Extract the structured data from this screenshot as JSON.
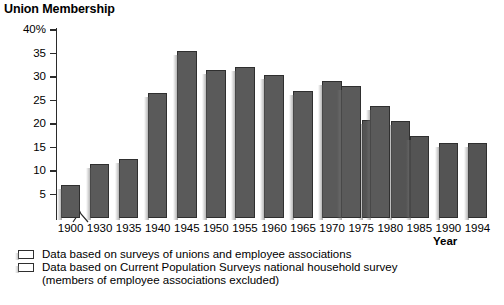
{
  "chart_data": {
    "type": "bar",
    "title": "Union Membership",
    "xlabel": "Year",
    "ylabel": "",
    "ylim": [
      0,
      40
    ],
    "ytick_labels": [
      "40%",
      "35",
      "30",
      "25",
      "20",
      "15",
      "10",
      "5"
    ],
    "ytick_values": [
      40,
      35,
      30,
      25,
      20,
      15,
      10,
      5
    ],
    "grid": false,
    "legend_position": "below-axis-left",
    "axis_break": true,
    "axis_break_note": "x-axis break between 1900 and 1930",
    "categories": [
      "1900",
      "1930",
      "1935",
      "1940",
      "1945",
      "1950",
      "1955",
      "1960",
      "1965",
      "1970",
      "1975",
      "1980",
      "1985",
      "1990",
      "1994"
    ],
    "series": [
      {
        "name": "Data based on surveys of unions and employee associations",
        "color": "#5a5a5a",
        "values": [
          7.0,
          11.5,
          12.6,
          26.5,
          35.5,
          31.5,
          32.2,
          30.4,
          27.1,
          29.1,
          28.1,
          23.8,
          null,
          null,
          null
        ]
      },
      {
        "name": "Data based on Current Population Surveys national household survey (members of employee associations excluded)",
        "color": "#545454",
        "values": [
          null,
          null,
          null,
          null,
          null,
          null,
          null,
          null,
          null,
          null,
          20.9,
          20.7,
          17.4,
          15.9,
          15.9
        ]
      }
    ]
  },
  "legend": {
    "entries": [
      {
        "label": "Data based on surveys of unions and employee associations",
        "swatch_color": "#5a5a5a"
      },
      {
        "label": "Data based on Current Population Surveys national household survey",
        "swatch_color": "#545454"
      }
    ],
    "note": "(members of employee associations excluded)"
  },
  "axis": {
    "title": "Union Membership",
    "x_title": "Year",
    "y_labels": [
      "40%",
      "35",
      "30",
      "25",
      "20",
      "15",
      "10",
      "5"
    ],
    "x_labels": [
      "1900",
      "1930",
      "1935",
      "1940",
      "1945",
      "1950",
      "1955",
      "1960",
      "1965",
      "1970",
      "1975",
      "1980",
      "1985",
      "1990",
      "1994"
    ]
  }
}
